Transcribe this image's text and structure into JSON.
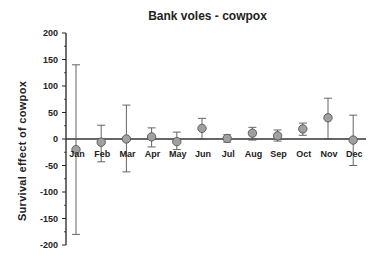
{
  "chart_data": {
    "type": "scatter",
    "title": "Bank voles - cowpox",
    "xlabel": "",
    "ylabel": "Survival effect of cowpox",
    "ylim": [
      -200,
      200
    ],
    "yticks": [
      200,
      150,
      100,
      50,
      0,
      -50,
      -100,
      -150,
      -200
    ],
    "grid": false,
    "legend": null,
    "categories": [
      "Jan",
      "Feb",
      "Mar",
      "Apr",
      "May",
      "Jun",
      "Jul",
      "Aug",
      "Sep",
      "Oct",
      "Nov",
      "Dec"
    ],
    "series": [
      {
        "name": "Survival effect",
        "values": [
          -20,
          -6,
          0,
          4,
          -5,
          20,
          1,
          11,
          6,
          19,
          40,
          -2
        ],
        "error_upper": [
          140,
          26,
          64,
          21,
          13,
          39,
          8,
          22,
          17,
          30,
          77,
          45
        ],
        "error_lower": [
          -180,
          -43,
          -62,
          -15,
          -20,
          0,
          -6,
          -2,
          -4,
          7,
          0,
          -50
        ],
        "marker_color": "#a0a0a0"
      }
    ],
    "annotations": [
      "Horizontal reference line at y = 0; month labels placed just below the zero line"
    ]
  }
}
